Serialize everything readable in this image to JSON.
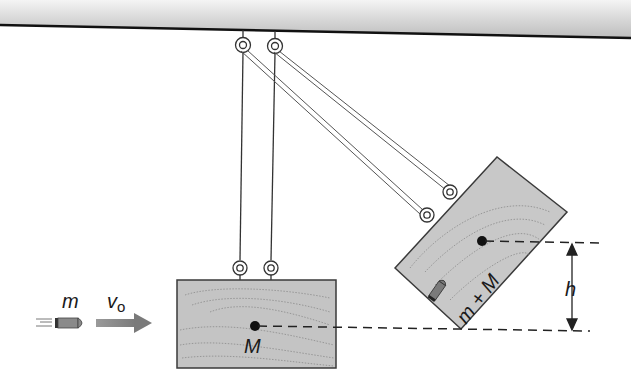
{
  "diagram": {
    "labels": {
      "bullet_mass": "m",
      "velocity": "v",
      "velocity_subscript": "o",
      "block_mass": "M",
      "combined_mass": "m + M",
      "height": "h"
    },
    "colors": {
      "block_fill": "#c4c4c4",
      "block_stroke": "#3a3a3a",
      "ceiling_line": "#111111",
      "bullet": "#7a7a7a",
      "arrow": "#8a8a8a",
      "dashes": "#222222"
    }
  }
}
